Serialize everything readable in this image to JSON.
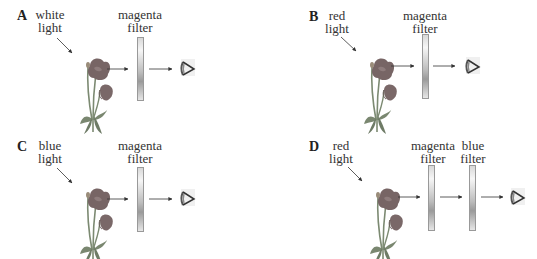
{
  "panels": [
    {
      "id": "A",
      "label": "A",
      "light": {
        "line1": "white",
        "line2": "light"
      },
      "filters": [
        {
          "line1": "magenta",
          "line2": "filter"
        }
      ]
    },
    {
      "id": "B",
      "label": "B",
      "light": {
        "line1": "red",
        "line2": "light"
      },
      "filters": [
        {
          "line1": "magenta",
          "line2": "filter"
        }
      ]
    },
    {
      "id": "C",
      "label": "C",
      "light": {
        "line1": "blue",
        "line2": "light"
      },
      "filters": [
        {
          "line1": "magenta",
          "line2": "filter"
        }
      ]
    },
    {
      "id": "D",
      "label": "D",
      "light": {
        "line1": "red",
        "line2": "light"
      },
      "filters": [
        {
          "line1": "magenta",
          "line2": "filter"
        },
        {
          "line1": "blue",
          "line2": "filter"
        }
      ]
    }
  ],
  "icons": {
    "flower": "poppy-flower-icon",
    "filter": "filter-bar",
    "eye": "eye-icon",
    "arrow": "arrow-right"
  },
  "colors": {
    "flower_petal": "#7a6a6a",
    "stem": "#7c8a72",
    "text": "#333333",
    "arrow": "#333333"
  }
}
